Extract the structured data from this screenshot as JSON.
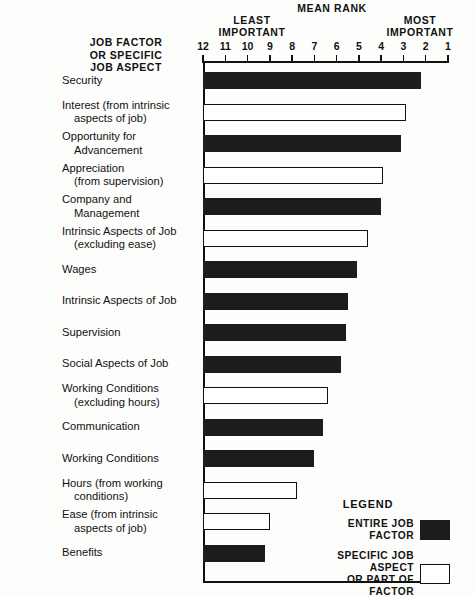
{
  "header": {
    "mean_rank": "MEAN RANK",
    "least_important": "LEAST\nIMPORTANT",
    "most_important": "MOST\nIMPORTANT",
    "y_axis_caption": "JOB FACTOR\nOR SPECIFIC\nJOB ASPECT"
  },
  "legend": {
    "title": "LEGEND",
    "entire_label": "ENTIRE JOB FACTOR",
    "specific_label": "SPECIFIC JOB ASPECT\nOR PART OF FACTOR"
  },
  "colors": {
    "entire_job_factor": "#1c1c1c",
    "specific_job_aspect": "#ffffff",
    "ink": "#111111",
    "background": "#fdfdfb"
  },
  "chart_data": {
    "type": "bar",
    "orientation": "horizontal",
    "title": "MEAN RANK",
    "xlabel": "MEAN RANK",
    "ylabel": "JOB FACTOR OR SPECIFIC JOB ASPECT",
    "xlim": [
      12,
      1
    ],
    "x_reversed": true,
    "xticks": [
      12,
      11,
      10,
      9,
      8,
      7,
      6,
      5,
      4,
      3,
      2,
      1
    ],
    "xtick_labels": [
      "12",
      "11",
      "10",
      "9",
      "8",
      "7",
      "6",
      "5",
      "4",
      "3",
      "2",
      "1"
    ],
    "axis_low_annotation": "LEAST IMPORTANT",
    "axis_high_annotation": "MOST IMPORTANT",
    "grid": false,
    "legend_position": "bottom-right",
    "legend_entries": [
      {
        "name": "ENTIRE JOB FACTOR",
        "color": "#1c1c1c"
      },
      {
        "name": "SPECIFIC JOB ASPECT OR PART OF FACTOR",
        "color": "#ffffff"
      }
    ],
    "categories": [
      "Security",
      "Interest (from intrinsic aspects of job)",
      "Opportunity for Advancement",
      "Appreciation (from supervision)",
      "Company and Management",
      "Intrinsic Aspects of Job (excluding ease)",
      "Wages",
      "Intrinsic Aspects of Job",
      "Supervision",
      "Social Aspects of Job",
      "Working Conditions (excluding hours)",
      "Communication",
      "Working Conditions",
      "Hours (from working conditions)",
      "Ease (from intrinsic aspects of job)",
      "Benefits"
    ],
    "values": [
      2.2,
      2.9,
      3.1,
      3.9,
      4.0,
      4.6,
      5.1,
      5.5,
      5.6,
      5.8,
      6.4,
      6.6,
      7.0,
      7.8,
      9.0,
      9.2
    ],
    "bars": [
      {
        "line1": "Security",
        "line2": "",
        "value": 2.2,
        "kind": "entire"
      },
      {
        "line1": "Interest (from intrinsic",
        "line2": "aspects of job)",
        "value": 2.9,
        "kind": "specific"
      },
      {
        "line1": "Opportunity for",
        "line2": "Advancement",
        "value": 3.1,
        "kind": "entire"
      },
      {
        "line1": "Appreciation",
        "line2": "(from supervision)",
        "value": 3.9,
        "kind": "specific"
      },
      {
        "line1": "Company and",
        "line2": "Management",
        "value": 4.0,
        "kind": "entire"
      },
      {
        "line1": "Intrinsic Aspects of Job",
        "line2": "(excluding ease)",
        "value": 4.6,
        "kind": "specific"
      },
      {
        "line1": "Wages",
        "line2": "",
        "value": 5.1,
        "kind": "entire"
      },
      {
        "line1": "Intrinsic Aspects of Job",
        "line2": "",
        "value": 5.5,
        "kind": "entire"
      },
      {
        "line1": "Supervision",
        "line2": "",
        "value": 5.6,
        "kind": "entire"
      },
      {
        "line1": "Social Aspects of Job",
        "line2": "",
        "value": 5.8,
        "kind": "entire"
      },
      {
        "line1": "Working Conditions",
        "line2": "(excluding hours)",
        "value": 6.4,
        "kind": "specific"
      },
      {
        "line1": "Communication",
        "line2": "",
        "value": 6.6,
        "kind": "entire"
      },
      {
        "line1": "Working Conditions",
        "line2": "",
        "value": 7.0,
        "kind": "entire"
      },
      {
        "line1": "Hours (from working",
        "line2": "conditions)",
        "value": 7.8,
        "kind": "specific"
      },
      {
        "line1": "Ease (from intrinsic",
        "line2": "aspects of job)",
        "value": 9.0,
        "kind": "specific"
      },
      {
        "line1": "Benefits",
        "line2": "",
        "value": 9.2,
        "kind": "entire"
      }
    ]
  }
}
